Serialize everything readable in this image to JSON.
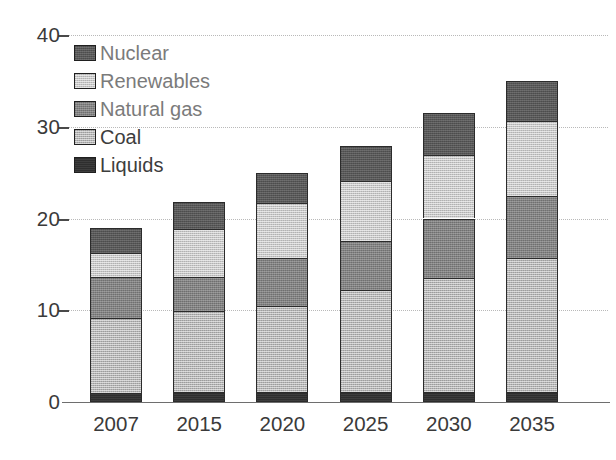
{
  "chart_data": {
    "type": "bar",
    "stacked": true,
    "title": "",
    "subtitle": "",
    "xlabel": "",
    "ylabel": "",
    "categories": [
      "2007",
      "2015",
      "2020",
      "2025",
      "2030",
      "2035"
    ],
    "ylim": [
      0,
      40
    ],
    "yticks": [
      0,
      10,
      20,
      30,
      40
    ],
    "ytick_labels": [
      "0",
      "10",
      "20",
      "30",
      "40"
    ],
    "grid": "horizontal-dotted",
    "legend_position": "top-left",
    "series": [
      {
        "name": "Liquids",
        "color": "#2e2e2e",
        "values": [
          1.0,
          1.1,
          1.1,
          1.1,
          1.1,
          1.1
        ]
      },
      {
        "name": "Coal",
        "color": "#b3b3b3",
        "values": [
          8.2,
          8.8,
          9.4,
          11.1,
          12.4,
          14.6
        ]
      },
      {
        "name": "Natural gas",
        "color": "#818181",
        "values": [
          4.4,
          3.7,
          5.2,
          5.4,
          6.5,
          6.8
        ]
      },
      {
        "name": "Renewables",
        "color": "#c6c6c6",
        "values": [
          2.6,
          5.3,
          6.0,
          6.5,
          6.9,
          8.1
        ]
      },
      {
        "name": "Nuclear",
        "color": "#575757",
        "values": [
          2.8,
          2.9,
          3.3,
          3.8,
          4.6,
          4.4
        ]
      }
    ],
    "totals": [
      19.0,
      21.8,
      25.0,
      27.9,
      31.5,
      35.0
    ],
    "legend_order": [
      "Nuclear",
      "Renewables",
      "Natural gas",
      "Coal",
      "Liquids"
    ]
  },
  "legend": {
    "items": [
      {
        "label": "Nuclear",
        "swatch": "nuclear-swatch"
      },
      {
        "label": "Renewables",
        "swatch": "renewables-swatch"
      },
      {
        "label": "Natural gas",
        "swatch": "natural-gas-swatch"
      },
      {
        "label": "Coal",
        "swatch": "coal-swatch"
      },
      {
        "label": "Liquids",
        "swatch": "liquids-swatch"
      }
    ]
  },
  "axes": {
    "y_tick_labels": [
      "40",
      "30",
      "20",
      "10",
      "0"
    ],
    "x_tick_labels": [
      "2007",
      "2015",
      "2020",
      "2025",
      "2030",
      "2035"
    ]
  },
  "colors": {
    "nuclear": "#575757",
    "renewables": "#c6c6c6",
    "natural_gas": "#818181",
    "coal": "#b3b3b3",
    "liquids": "#2e2e2e",
    "axis": "#6e6e6e",
    "grid": "#b9b9b9",
    "text": "#3a3a3a",
    "legend_text": "#7b7b7b"
  }
}
